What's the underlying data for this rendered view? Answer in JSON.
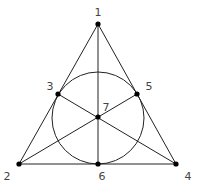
{
  "points": [
    {
      "id": "1",
      "x": 98,
      "y": 24,
      "lx": 98,
      "ly": 16
    },
    {
      "id": "2",
      "x": 19,
      "y": 164,
      "lx": 7,
      "ly": 180
    },
    {
      "id": "3",
      "x": 58,
      "y": 94,
      "lx": 50,
      "ly": 90
    },
    {
      "id": "4",
      "x": 176,
      "y": 164,
      "lx": 188,
      "ly": 180
    },
    {
      "id": "5",
      "x": 137,
      "y": 94,
      "lx": 149,
      "ly": 90
    },
    {
      "id": "6",
      "x": 98,
      "y": 164,
      "lx": 102,
      "ly": 180
    },
    {
      "id": "7",
      "x": 98,
      "y": 117,
      "lx": 106,
      "ly": 111
    }
  ],
  "lines": [
    [
      "1",
      "2"
    ],
    [
      "1",
      "4"
    ],
    [
      "2",
      "4"
    ],
    [
      "1",
      "6"
    ],
    [
      "2",
      "5"
    ],
    [
      "4",
      "3"
    ]
  ],
  "circle": {
    "cx": 98,
    "cy": 118,
    "r": 46
  }
}
